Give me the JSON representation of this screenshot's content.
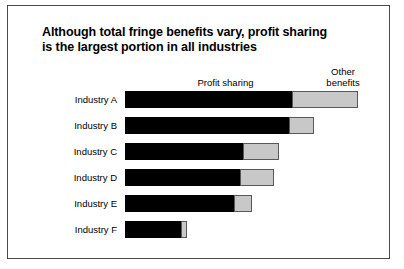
{
  "chart_data": {
    "type": "bar",
    "orientation": "horizontal",
    "stacked": true,
    "title": "Although total fringe benefits vary, profit sharing is the largest portion in all industries",
    "title_lines": [
      "Although total fringe benefits vary, profit sharing",
      "is the largest portion in all industries"
    ],
    "xlabel": "",
    "ylabel": "",
    "grid": false,
    "legend_position": "above-bars",
    "axis_tick_labels": [],
    "categories": [
      "Industry A",
      "Industry B",
      "Industry C",
      "Industry D",
      "Industry E",
      "Industry F"
    ],
    "series": [
      {
        "name": "Profit sharing",
        "color": "#000000",
        "values": [
          167,
          164,
          118,
          115,
          109,
          56
        ]
      },
      {
        "name": "Other benefits",
        "color": "#c8c8c8",
        "values": [
          66,
          25,
          36,
          34,
          18,
          6
        ]
      }
    ],
    "totals": [
      233,
      189,
      154,
      149,
      127,
      62
    ],
    "annotations": [
      {
        "text": "Profit sharing",
        "target_series": "Profit sharing"
      },
      {
        "text": "Other benefits",
        "target_series": "Other benefits"
      }
    ]
  },
  "figure": {
    "background_color": "#ffffff",
    "frame_color": "#4a4a4a",
    "primary_color": "#000000",
    "secondary_color": "#c8c8c8",
    "secondary_border_color": "#585858"
  },
  "labels": {
    "profit_sharing": "Profit sharing",
    "other_benefits_line1": "Other",
    "other_benefits_line2": "benefits"
  }
}
